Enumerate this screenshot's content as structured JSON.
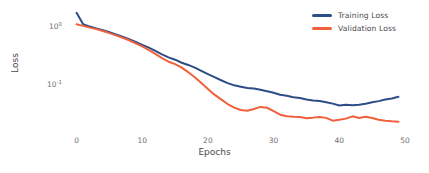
{
  "chart_data": {
    "type": "line",
    "title": "",
    "xlabel": "Epochs",
    "ylabel": "Loss",
    "yscale": "log",
    "xlim": [
      -1,
      50
    ],
    "ylim": [
      0.035,
      1.55
    ],
    "grid": false,
    "legend_position": "top-right",
    "xticks": [
      0,
      10,
      20,
      30,
      40,
      50
    ],
    "xticklabels": [
      "0",
      "10",
      "20",
      "30",
      "40",
      "50"
    ],
    "yticks": [
      1.0,
      0.1
    ],
    "yticklabels": [
      "10",
      "10"
    ],
    "ytick_exponents": [
      "0",
      "-1"
    ],
    "x": [
      0,
      1,
      2,
      3,
      4,
      5,
      6,
      7,
      8,
      9,
      10,
      11,
      12,
      13,
      14,
      15,
      16,
      17,
      18,
      19,
      20,
      21,
      22,
      23,
      24,
      25,
      26,
      27,
      28,
      29,
      30,
      31,
      32,
      33,
      34,
      35,
      36,
      37,
      38,
      39,
      40,
      41,
      42,
      43,
      44,
      45,
      46,
      47,
      48,
      49
    ],
    "series": [
      {
        "name": "Training Loss",
        "color": "#2d4d86",
        "values": [
          1.42,
          1.0,
          0.93,
          0.88,
          0.83,
          0.78,
          0.73,
          0.68,
          0.63,
          0.58,
          0.53,
          0.485,
          0.44,
          0.395,
          0.36,
          0.335,
          0.305,
          0.285,
          0.262,
          0.238,
          0.215,
          0.196,
          0.178,
          0.163,
          0.152,
          0.146,
          0.14,
          0.138,
          0.133,
          0.127,
          0.121,
          0.114,
          0.11,
          0.1055,
          0.103,
          0.0985,
          0.0955,
          0.094,
          0.0905,
          0.0865,
          0.0815,
          0.0835,
          0.0825,
          0.0835,
          0.0862,
          0.0905,
          0.0935,
          0.098,
          0.1015,
          0.107
        ]
      },
      {
        "name": "Validation Loss",
        "color": "#f1603c",
        "values": [
          1.0,
          0.95,
          0.9,
          0.86,
          0.81,
          0.76,
          0.71,
          0.66,
          0.61,
          0.555,
          0.505,
          0.45,
          0.4,
          0.352,
          0.315,
          0.292,
          0.263,
          0.228,
          0.195,
          0.163,
          0.136,
          0.114,
          0.0985,
          0.0855,
          0.0765,
          0.0712,
          0.0695,
          0.0732,
          0.0782,
          0.0762,
          0.0685,
          0.0615,
          0.0588,
          0.0578,
          0.0572,
          0.0552,
          0.0562,
          0.0575,
          0.0558,
          0.0512,
          0.0525,
          0.0545,
          0.0585,
          0.0555,
          0.0578,
          0.0555,
          0.0528,
          0.0512,
          0.0502,
          0.0495
        ]
      }
    ]
  },
  "legend": {
    "items": [
      {
        "label": "Training Loss",
        "color": "#2d4d86"
      },
      {
        "label": "Validation Loss",
        "color": "#f1603c"
      }
    ]
  },
  "axes": {
    "x_label": "Epochs",
    "y_label": "Loss",
    "x_tick_labels": [
      "0",
      "10",
      "20",
      "30",
      "40",
      "50"
    ],
    "y_tick_mantissa": "10",
    "y_tick_exp_top": "0",
    "y_tick_exp_bottom": "-1"
  }
}
